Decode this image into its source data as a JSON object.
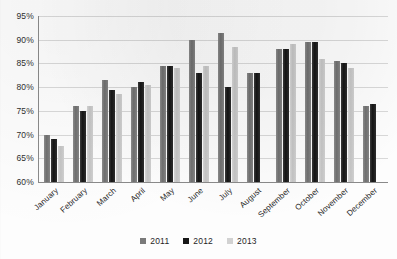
{
  "chart_data": {
    "type": "bar",
    "title": "",
    "subtitle": "",
    "xlabel": "",
    "ylabel": "",
    "ylim": [
      60,
      95
    ],
    "ytick_labels": [
      "95%",
      "90%",
      "85%",
      "80%",
      "75%",
      "70%",
      "65%",
      "60%"
    ],
    "yticks": [
      95,
      90,
      85,
      80,
      75,
      70,
      65,
      60
    ],
    "grid": true,
    "legend_position": "bottom",
    "categories": [
      "January",
      "February",
      "March",
      "April",
      "May",
      "June",
      "July",
      "August",
      "September",
      "October",
      "November",
      "December"
    ],
    "series": [
      {
        "name": "2011",
        "color": "#7a7a7a",
        "values": [
          70.0,
          76.0,
          81.5,
          80.0,
          84.5,
          90.0,
          91.5,
          83.0,
          88.0,
          89.5,
          85.5,
          76.0
        ]
      },
      {
        "name": "2012",
        "color": "#171717",
        "values": [
          69.0,
          75.0,
          79.5,
          81.0,
          84.5,
          83.0,
          80.0,
          83.0,
          88.0,
          89.5,
          85.0,
          76.5
        ]
      },
      {
        "name": "2013",
        "color": "#d2d2d2",
        "values": [
          67.5,
          76.0,
          78.5,
          80.5,
          84.0,
          84.5,
          88.5,
          null,
          89.0,
          86.0,
          84.0,
          null
        ]
      }
    ]
  },
  "legend": {
    "items": [
      {
        "label": "2011",
        "series": "s2011"
      },
      {
        "label": "2012",
        "series": "s2012"
      },
      {
        "label": "2013",
        "series": "s2013"
      }
    ]
  }
}
